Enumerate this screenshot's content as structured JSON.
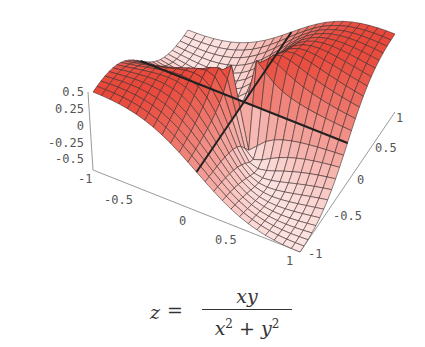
{
  "chart_data": {
    "type": "surface3d",
    "title": "",
    "function": "z = xy / (x^2 + y^2)",
    "caption": {
      "lhs": "z",
      "equals": "=",
      "numerator": "xy",
      "denominator_parts": [
        "x",
        "2",
        " + y",
        "2"
      ]
    },
    "x_range": [
      -1,
      1
    ],
    "y_range": [
      -1,
      1
    ],
    "z_range": [
      -0.5,
      0.5
    ],
    "x_ticks": [
      "-1",
      "-0.5",
      "0",
      "0.5",
      "1"
    ],
    "y_ticks": [
      "-1",
      "-0.5",
      "0",
      "0.5",
      "1"
    ],
    "z_ticks": [
      "0.5",
      "0.25",
      "0",
      "-0.25",
      "-0.5"
    ],
    "grid_resolution": 24,
    "highlight_lines": [
      "x = 0",
      "y = 0"
    ],
    "colors": {
      "high": "#e8483a",
      "low": "#ffffff",
      "mesh": "#3a2a2a",
      "highlight": "#222222",
      "box": "#9a9a9a"
    },
    "grid": true,
    "legend": null
  }
}
